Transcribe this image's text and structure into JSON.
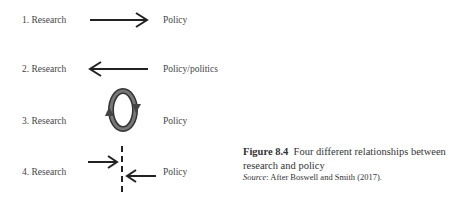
{
  "diagram": {
    "rows": [
      {
        "left": "1. Research",
        "right": "Policy",
        "relation": "arrow-right"
      },
      {
        "left": "2. Research",
        "right": "Policy/politics",
        "relation": "arrow-left"
      },
      {
        "left": "3. Research",
        "right": "Policy",
        "relation": "cycle"
      },
      {
        "left": "4. Research",
        "right": "Policy",
        "relation": "opposing-arrows-with-barrier"
      }
    ]
  },
  "caption": {
    "figure_number": "Figure 8.4",
    "title": "Four different relationships between research and policy",
    "source_label": "Source",
    "source_text": ": After Boswell and Smith (2017)."
  },
  "colors": {
    "text": "#444444",
    "arrow": "#222222",
    "cycle_fill": "#555555"
  }
}
